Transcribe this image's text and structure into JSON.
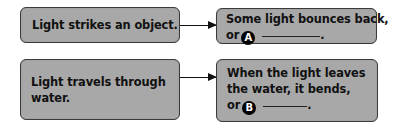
{
  "diagram": {
    "type": "cause-effect flow",
    "rows": [
      {
        "cause": "Light strikes an object.",
        "effect": {
          "lines": [
            "Some light bounces back,"
          ],
          "prefix": "or",
          "badge": "A",
          "suffix": "."
        }
      },
      {
        "cause": "Light travels through water.",
        "effect": {
          "lines": [
            "When the light leaves",
            "the water, it bends,"
          ],
          "prefix": "or",
          "badge": "B",
          "suffix": "."
        }
      }
    ],
    "colors": {
      "box_fill": "#a8a8a8",
      "box_border": "#3a3a3a",
      "text": "#111111",
      "badge_bg": "#000000",
      "badge_text": "#ffffff"
    }
  }
}
